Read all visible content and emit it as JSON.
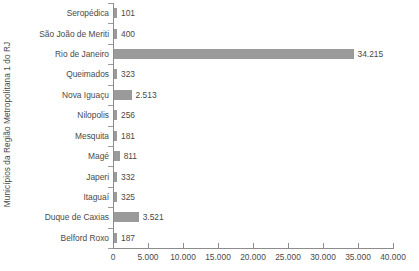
{
  "chart_data": {
    "type": "bar",
    "orientation": "horizontal",
    "title": "",
    "xlabel": "",
    "ylabel": "Municípios da Região Metropolitana 1 do RJ",
    "xlim": [
      0,
      40000
    ],
    "grid": false,
    "legend": null,
    "bar_color": "#9a9a9a",
    "text_color": "#4a4a4a",
    "axis_color": "#8c8c8c",
    "x_ticks": [
      0,
      5000,
      10000,
      15000,
      20000,
      25000,
      30000,
      35000,
      40000
    ],
    "x_tick_labels": [
      "0",
      "5.000",
      "10.000",
      "15.000",
      "20.000",
      "25.000",
      "30.000",
      "35.000",
      "40.000"
    ],
    "categories": [
      "Seropédica",
      "São João de Meriti",
      "Rio de Janeiro",
      "Queimados",
      "Nova Iguaçu",
      "Nilopolis",
      "Mesquita",
      "Magé",
      "Japeri",
      "Itaguaí",
      "Duque de Caxias",
      "Belford Roxo"
    ],
    "values": [
      101,
      400,
      34215,
      323,
      2513,
      256,
      181,
      811,
      332,
      325,
      3521,
      187
    ],
    "value_labels": [
      "101",
      "400",
      "34.215",
      "323",
      "2.513",
      "256",
      "181",
      "811",
      "332",
      "325",
      "3.521",
      "187"
    ]
  }
}
